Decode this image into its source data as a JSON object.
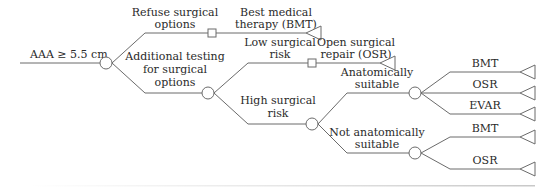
{
  "diagram": {
    "type": "decision-tree",
    "root": {
      "label": "AAA ≥ 5.5 cm"
    },
    "branches": {
      "refuse": {
        "line1": "Refuse surgical",
        "line2": "options"
      },
      "bmt_outcome": {
        "line1": "Best medical",
        "line2": "therapy (BMT)"
      },
      "additional": {
        "line1": "Additional testing",
        "line2": "for surgical",
        "line3": "options"
      },
      "low_risk": {
        "line1": "Low surgical",
        "line2": "risk"
      },
      "osr_outcome": {
        "line1": "Open surgical",
        "line2": "repair (OSR)"
      },
      "high_risk": {
        "line1": "High surgical",
        "line2": "risk"
      },
      "anat_suitable": {
        "line1": "Anatomically",
        "line2": "suitable"
      },
      "not_anat_suitable": {
        "line1": "Not anatomically",
        "line2": "suitable"
      }
    },
    "suitable_options": [
      "BMT",
      "OSR",
      "EVAR"
    ],
    "not_suitable_options": [
      "BMT",
      "OSR"
    ],
    "legend": {
      "circle": "chance-node",
      "square": "decision-node",
      "triangle": "terminal-node"
    },
    "colors": {
      "line": "#6b6b6b",
      "text": "#2a2a2a"
    }
  }
}
